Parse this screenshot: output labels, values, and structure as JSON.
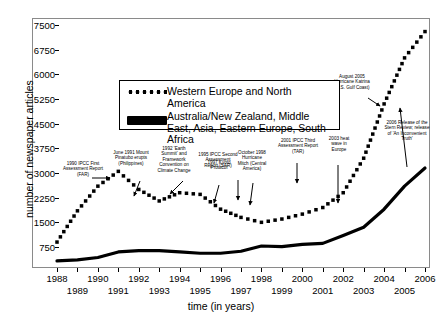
{
  "chart_data": {
    "type": "line",
    "title": "",
    "xlabel": "time (in years)",
    "ylabel": "number of newspaper articles",
    "xlim": [
      1988,
      2006
    ],
    "ylim": [
      0,
      7875
    ],
    "grid": false,
    "legend_position": "upper-center",
    "x": [
      1988,
      1989,
      1990,
      1991,
      1992,
      1993,
      1994,
      1995,
      1996,
      1997,
      1998,
      1999,
      2000,
      2001,
      2002,
      2003,
      2004,
      2005,
      2006
    ],
    "yticks": [
      750,
      1500,
      2250,
      3000,
      3750,
      4500,
      5250,
      6000,
      6750,
      7500
    ],
    "xticks_row1": [
      1988,
      1990,
      1992,
      1994,
      1996,
      1998,
      2000,
      2002,
      2004,
      2006
    ],
    "xticks_row2": [
      1989,
      1991,
      1993,
      1995,
      1997,
      1999,
      2001,
      2003,
      2005
    ],
    "series": [
      {
        "name": "Western Europe and North America",
        "style": "dotted",
        "values": [
          900,
          1850,
          2600,
          3050,
          2500,
          2150,
          2400,
          2350,
          1900,
          1650,
          1500,
          1600,
          1750,
          1700,
          2250,
          2300,
          2250,
          1800,
          2000
        ]
      },
      {
        "name": "Australia/New Zealand, Middle East, Asia, Eastern Europe, South Africa",
        "style": "solid",
        "values": [
          330,
          360,
          430,
          600,
          640,
          640,
          600,
          560,
          560,
          620,
          780,
          760,
          830,
          860,
          900,
          830,
          980,
          1250,
          1600
        ]
      }
    ],
    "series_extra": {
      "dotted_tail": [
        1950,
        2400,
        3450,
        5100,
        6500,
        7300
      ],
      "solid_tail": [
        1100,
        1350,
        1900,
        2600,
        3150
      ]
    },
    "annotations": [
      {
        "id": "far",
        "text": "1990 IPCC First Assessment Report (FAR)"
      },
      {
        "id": "pinatubo",
        "text": "June 1991 Mount Pinatubo erupts (Philippines)"
      },
      {
        "id": "earth-summit",
        "text": "1992 'Earth Summit' and Framework Convention on Climate Change"
      },
      {
        "id": "sar",
        "text": "1995 IPCC Second Assessment Report (SAR)"
      },
      {
        "id": "kyoto",
        "text": "1997 Kyoto Protocol"
      },
      {
        "id": "mitch",
        "text": "October 1998 Hurricane Mitch (Central America)"
      },
      {
        "id": "tar",
        "text": "2001 IPCC Third Assessment Report (TAR)"
      },
      {
        "id": "heatwave",
        "text": "2003 heat wave in Europe"
      },
      {
        "id": "katrina",
        "text": "August 2005 Hurricane Katrina (U.S. Gulf Coast)"
      },
      {
        "id": "stern",
        "text": "2006 Release of the Stern Review; release of 'An Inconvenient Truth'"
      }
    ]
  },
  "legend": {
    "entries": [
      {
        "label": "Western Europe and North America"
      },
      {
        "label": "Australia/New Zealand, Middle East, Asia, Eastern Europe, South Africa"
      }
    ]
  }
}
